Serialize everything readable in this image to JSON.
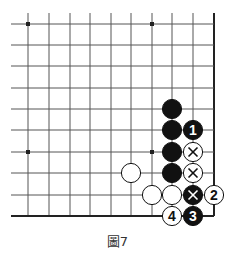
{
  "diagram": {
    "caption": "圖7",
    "board": {
      "grid_x": [
        28,
        49,
        70,
        90,
        111,
        131,
        152,
        172,
        193,
        214
      ],
      "grid_y": [
        24,
        45,
        66,
        88,
        109,
        130,
        152,
        173,
        195,
        216
      ],
      "top_extend": 13,
      "left_extend": 17,
      "right_edge_thick": true,
      "bottom_edge_thick": true,
      "line_color": "#555555",
      "edge_color": "#222222",
      "star_points": [
        [
          0,
          0
        ],
        [
          6,
          0
        ],
        [
          0,
          6
        ],
        [
          6,
          6
        ]
      ]
    },
    "stones": [
      {
        "col": 7,
        "row": 4,
        "color": "black",
        "label": ""
      },
      {
        "col": 7,
        "row": 5,
        "color": "black",
        "label": ""
      },
      {
        "col": 7,
        "row": 6,
        "color": "black",
        "label": ""
      },
      {
        "col": 7,
        "row": 7,
        "color": "black",
        "label": ""
      },
      {
        "col": 8,
        "row": 5,
        "color": "black",
        "label": "1"
      },
      {
        "col": 8,
        "row": 6,
        "color": "white",
        "label": "×"
      },
      {
        "col": 8,
        "row": 7,
        "color": "white",
        "label": "×"
      },
      {
        "col": 5,
        "row": 7,
        "color": "white",
        "label": ""
      },
      {
        "col": 6,
        "row": 8,
        "color": "white",
        "label": ""
      },
      {
        "col": 7,
        "row": 8,
        "color": "white",
        "label": ""
      },
      {
        "col": 8,
        "row": 8,
        "color": "black",
        "label": "×"
      },
      {
        "col": 9,
        "row": 8,
        "color": "white",
        "label": "2"
      },
      {
        "col": 7,
        "row": 9,
        "color": "white",
        "label": "4"
      },
      {
        "col": 8,
        "row": 9,
        "color": "black",
        "label": "3"
      }
    ]
  }
}
